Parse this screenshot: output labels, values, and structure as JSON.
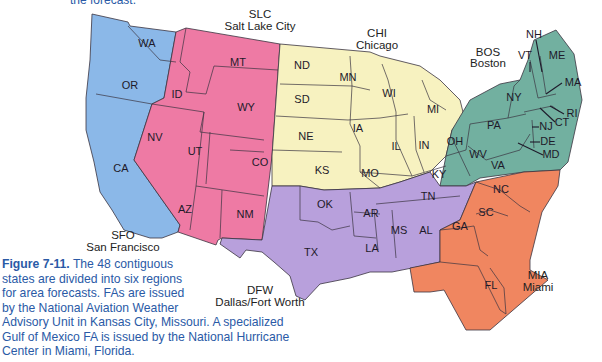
{
  "top_fragment": "the forecast.",
  "regions": [
    {
      "code": "SFO",
      "name": "San Francisco",
      "color": "#8bb8e8",
      "states": [
        "WA",
        "OR",
        "CA"
      ]
    },
    {
      "code": "SLC",
      "name": "Salt Lake City",
      "color": "#ee7aa4",
      "states": [
        "MT",
        "ID",
        "WY",
        "NV",
        "UT",
        "CO",
        "AZ",
        "NM"
      ]
    },
    {
      "code": "CHI",
      "name": "Chicago",
      "color": "#f7f2c0",
      "states": [
        "ND",
        "SD",
        "NE",
        "KS",
        "MN",
        "IA",
        "MO",
        "WI",
        "IL",
        "MI",
        "IN",
        "KY"
      ]
    },
    {
      "code": "BOS",
      "name": "Boston",
      "color": "#72b0a0",
      "states": [
        "ME",
        "NH",
        "VT",
        "MA",
        "RI",
        "CT",
        "NY",
        "NJ",
        "PA",
        "DE",
        "MD",
        "OH",
        "WV",
        "VA"
      ]
    },
    {
      "code": "DFW",
      "name": "Dallas/Fort Worth",
      "color": "#b8a0dc",
      "states": [
        "OK",
        "TX",
        "AR",
        "LA",
        "MS",
        "AL",
        "TN"
      ]
    },
    {
      "code": "MIA",
      "name": "Miami",
      "color": "#f08660",
      "states": [
        "NC",
        "SC",
        "GA",
        "FL"
      ]
    }
  ],
  "labels": {
    "WA": "WA",
    "OR": "OR",
    "CA": "CA",
    "ID": "ID",
    "MT": "MT",
    "WY": "WY",
    "NV": "NV",
    "UT": "UT",
    "CO": "CO",
    "AZ": "AZ",
    "NM": "NM",
    "ND": "ND",
    "SD": "SD",
    "NE": "NE",
    "KS": "KS",
    "MN": "MN",
    "IA": "IA",
    "MO": "MO",
    "WI": "WI",
    "IL": "IL",
    "MI": "MI",
    "IN": "IN",
    "KY": "KY",
    "OK": "OK",
    "TX": "TX",
    "AR": "AR",
    "LA": "LA",
    "MS": "MS",
    "AL": "AL",
    "TN": "TN",
    "NC": "NC",
    "SC": "SC",
    "GA": "GA",
    "FL": "FL",
    "OH": "OH",
    "WV": "WV",
    "VA": "VA",
    "PA": "PA",
    "NY": "NY",
    "NJ": "NJ",
    "DE": "DE",
    "MD": "MD",
    "CT": "CT",
    "RI": "RI",
    "MA": "MA",
    "VT": "VT",
    "NH": "NH",
    "ME": "ME"
  },
  "caption": {
    "figure_label": "Figure 7-11.",
    "text_part1": " The 48 contiguous states are divided into six regions for area forecasts. FAs are issued by the National Aviation Weather",
    "text_part2": "Advisory Unit in Kansas City, Missouri. A specialized Gulf of Mexico FA is issued by the National Hurricane Center in Miami, Florida."
  }
}
